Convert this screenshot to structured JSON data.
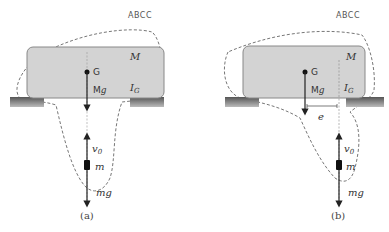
{
  "figure": {
    "header_text": "ABCC",
    "panels": [
      {
        "id": "a",
        "caption": "(a)",
        "labels": {
          "body_mass": "M",
          "center_of_gravity": "G",
          "body_weight": "Mg",
          "moment_of_inertia": "I_G",
          "velocity": "v_0",
          "projectile_mass": "m",
          "projectile_weight": "mg"
        }
      },
      {
        "id": "b",
        "caption": "(b)",
        "labels": {
          "body_mass": "M",
          "center_of_gravity": "G",
          "body_weight": "Mg",
          "moment_of_inertia": "I_G",
          "eccentricity": "e",
          "velocity": "v_0",
          "projectile_mass": "m",
          "projectile_weight": "mg"
        }
      }
    ],
    "colors": {
      "body_fill": "#d3d3d3",
      "body_stroke": "#888888",
      "support": "#7a7a7a",
      "arrow": "#222222",
      "dashed": "#777777"
    }
  }
}
